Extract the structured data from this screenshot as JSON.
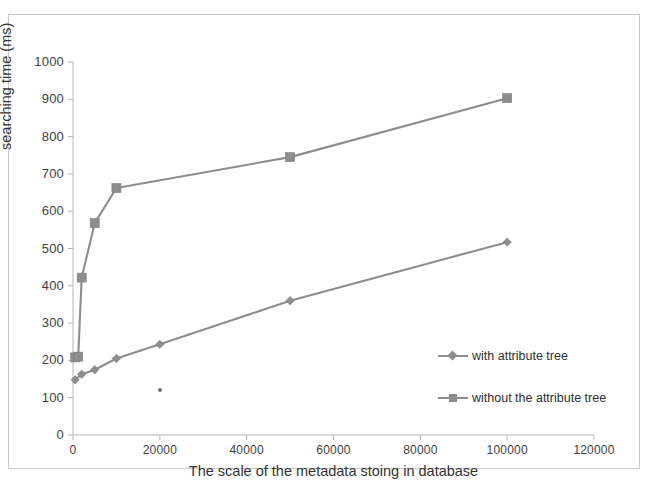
{
  "chart_data": {
    "type": "line",
    "title": "",
    "xlabel": "The scale of the metadata stoing in database",
    "ylabel": "searching time (ms)",
    "xlim": [
      0,
      120000
    ],
    "ylim": [
      0,
      1000
    ],
    "xticks": [
      0,
      20000,
      40000,
      60000,
      80000,
      100000,
      120000
    ],
    "yticks": [
      0,
      100,
      200,
      300,
      400,
      500,
      600,
      700,
      800,
      900,
      1000
    ],
    "xtick_labels": [
      "0",
      "20000",
      "40000",
      "60000",
      "80000",
      "100000",
      "120000"
    ],
    "ytick_labels": [
      "0",
      "100",
      "200",
      "300",
      "400",
      "500",
      "600",
      "700",
      "800",
      "900",
      "1000"
    ],
    "grid": false,
    "legend_position": "right-inside",
    "series": [
      {
        "name": "with attribute tree",
        "marker": "diamond",
        "color": "#8d8d8d",
        "x": [
          500,
          2000,
          5000,
          10000,
          20000,
          50000,
          100000
        ],
        "values": [
          148,
          163,
          175,
          205,
          243,
          360,
          517
        ]
      },
      {
        "name": "without the attribute tree",
        "marker": "square",
        "color": "#8d8d8d",
        "x": [
          500,
          1200,
          2000,
          5000,
          10000,
          50000,
          100000
        ],
        "values": [
          208,
          210,
          422,
          568,
          662,
          745,
          903
        ]
      }
    ]
  },
  "axes": {
    "y_title": "searching time (ms)",
    "x_title": "The scale of the metadata stoing in database"
  },
  "legend": {
    "items": [
      {
        "label": "with attribute tree",
        "marker": "diamond"
      },
      {
        "label": "without the attribute tree",
        "marker": "square"
      }
    ]
  }
}
